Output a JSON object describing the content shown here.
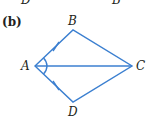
{
  "top_fragment": {
    "left_label": "D",
    "right_label": "B"
  },
  "figure": {
    "part_label": "(b)",
    "vertices": {
      "A": {
        "label": "A",
        "x": 35,
        "y": 66
      },
      "B": {
        "label": "B",
        "x": 73,
        "y": 30
      },
      "C": {
        "label": "C",
        "x": 132,
        "y": 66
      },
      "D": {
        "label": "D",
        "x": 73,
        "y": 102
      }
    },
    "segments": [
      "AB",
      "BC",
      "CD",
      "DA",
      "AC"
    ],
    "tick_marks": [
      "AB",
      "AD"
    ],
    "angle_marks": [
      "BAC",
      "CAD"
    ],
    "line_color": "#3b7fd0"
  }
}
